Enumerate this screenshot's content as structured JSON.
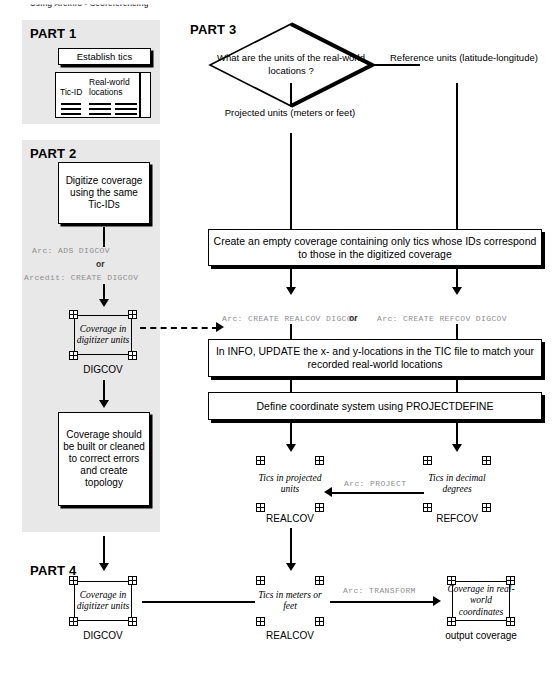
{
  "page": {
    "header_fragment": "Using ArcInfo  •  Georeferencing"
  },
  "parts": {
    "part1": {
      "title": "PART 1"
    },
    "part2": {
      "title": "PART 2"
    },
    "part3": {
      "title": "PART 3"
    },
    "part4": {
      "title": "PART 4"
    }
  },
  "part1": {
    "establish_box": "Establish tics",
    "table": {
      "col1_header": "Tic-ID",
      "col2_header": "Real-world locations"
    }
  },
  "part2": {
    "digitize_box": "Digitize coverage using the same Tic-IDs",
    "cmd_ads": "Arc: ADS DIGCOV",
    "or_label": "or",
    "cmd_arcedit": "Arcedit: CREATE DIGCOV",
    "coverage_caption": "Coverage in digitizer units",
    "coverage_name": "DIGCOV",
    "clean_box": "Coverage should be built or cleaned to correct errors and create topology"
  },
  "part3": {
    "question": "What are the units of the real-world locations ?",
    "branch_left": "Projected units (meters or feet)",
    "branch_right": "Reference units (latitude-longitude)",
    "box_create": "Create an empty coverage containing only tics whose IDs correspond to those in the digitized coverage",
    "cmd_realcov": "Arc: CREATE REALCOV DIGCOV",
    "cmd_or": "or",
    "cmd_refcov": "Arc: CREATE REFCOV DIGCOV",
    "box_update": "In INFO, UPDATE the x- and y-locations in the TIC file to match your recorded real-world locations",
    "box_define": "Define coordinate system using PROJECTDEFINE",
    "realcov_caption": "Tics in projected units",
    "realcov_name": "REALCOV",
    "refcov_caption": "Tics in decimal degrees",
    "refcov_name": "REFCOV",
    "cmd_project": "Arc: PROJECT"
  },
  "part4": {
    "digcov_caption": "Coverage in digitizer units",
    "digcov_name": "DIGCOV",
    "realcov_caption": "Tics in meters or feet",
    "realcov_name": "REALCOV",
    "cmd_transform": "Arc: TRANSFORM",
    "output_caption": "Coverage in real-world coordinates",
    "output_name": "output coverage"
  },
  "colors": {
    "panel_bg": "#e8e8e8",
    "line": "#000000",
    "command_text": "#8e8e8e"
  }
}
